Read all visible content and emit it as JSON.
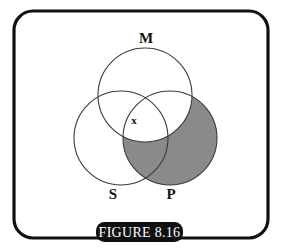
{
  "figure": {
    "caption": "FIGURE 8.16",
    "border_color": "#111111",
    "background_color": "#ffffff",
    "caption_pill_color": "#111111",
    "caption_text_color": "#ffffff",
    "shade_color": "#8a8a8a",
    "circle_stroke_color": "#3a3a3a"
  },
  "diagram": {
    "type": "venn-three-circle",
    "circles": [
      {
        "label": "M",
        "cx": 145,
        "cy": 95,
        "r": 47,
        "label_x": 146,
        "label_y": 43
      },
      {
        "label": "S",
        "cx": 121,
        "cy": 138,
        "r": 47,
        "label_x": 113,
        "label_y": 199
      },
      {
        "label": "P",
        "cx": 170,
        "cy": 138,
        "r": 47,
        "label_x": 171,
        "label_y": 199
      }
    ],
    "marks": [
      {
        "symbol": "x",
        "x": 134,
        "y": 124,
        "region": "S and M, not P"
      }
    ],
    "shaded_regions": [
      {
        "description": "P minus M",
        "fill": "#8a8a8a"
      }
    ]
  }
}
